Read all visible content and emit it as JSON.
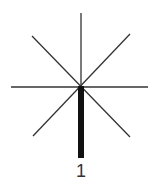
{
  "diagram": {
    "label": "1",
    "stroke_color": "#333333",
    "bar_color": "#111111",
    "center": [
      81,
      87
    ],
    "rays": 8
  }
}
